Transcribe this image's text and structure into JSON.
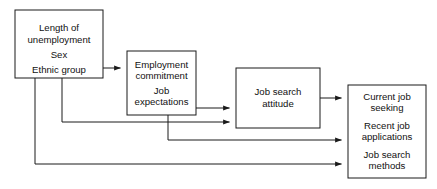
{
  "diagram": {
    "background_color": "#ffffff",
    "line_color": "#1a1a1a",
    "text_color": "#111111",
    "nodes": [
      {
        "id": "demographics",
        "name": "demographics-box",
        "lines": [
          "Length of",
          "unemployment",
          "Sex",
          "Ethnic group"
        ],
        "line1": "Length of",
        "line2": "unemployment",
        "line3": "Sex",
        "line4": "Ethnic group"
      },
      {
        "id": "commitment",
        "name": "employment-commitment-box",
        "lines": [
          "Employment",
          "commitment",
          "Job",
          "expectations"
        ],
        "line1": "Employment",
        "line2": "commitment",
        "line3": "Job",
        "line4": "expectations"
      },
      {
        "id": "attitude",
        "name": "job-search-attitude-box",
        "lines": [
          "Job search",
          "attitude"
        ],
        "line1": "Job search",
        "line2": "attitude"
      },
      {
        "id": "outcomes",
        "name": "job-search-outcomes-box",
        "lines": [
          "Current job",
          "seeking",
          "Recent job",
          "applications",
          "Job search",
          "methods"
        ],
        "line1": "Current job",
        "line2": "seeking",
        "line3": "Recent job",
        "line4": "applications",
        "line5": "Job search",
        "line6": "methods"
      }
    ],
    "edges": [
      {
        "id": "e1",
        "name": "edge-demographics-to-commitment",
        "from": "demographics",
        "to": "commitment"
      },
      {
        "id": "e2",
        "name": "edge-demographics-to-attitude",
        "from": "demographics",
        "to": "attitude"
      },
      {
        "id": "e3",
        "name": "edge-demographics-to-outcomes",
        "from": "demographics",
        "to": "outcomes"
      },
      {
        "id": "e4",
        "name": "edge-commitment-to-attitude",
        "from": "commitment",
        "to": "attitude"
      },
      {
        "id": "e5",
        "name": "edge-commitment-to-outcomes",
        "from": "commitment",
        "to": "outcomes"
      },
      {
        "id": "e6",
        "name": "edge-attitude-to-outcomes",
        "from": "attitude",
        "to": "outcomes"
      }
    ]
  }
}
